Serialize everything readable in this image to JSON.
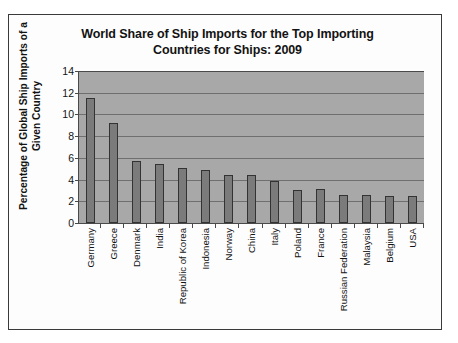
{
  "chart_data": {
    "type": "bar",
    "title": "World Share of Ship Imports for the Top Importing Countries for Ships: 2009",
    "title_lines": [
      "World Share of Ship Imports for the Top Importing",
      "Countries for Ships: 2009"
    ],
    "xlabel": "",
    "ylabel": "Percentage of Global Ship Imports of a Given Country",
    "ylabel_lines": [
      "Percentage of Global Ship Imports of a",
      "Given Country"
    ],
    "ylim": [
      0,
      14
    ],
    "ytick_step": 2,
    "yticks": [
      14,
      12,
      10,
      8,
      6,
      4,
      2,
      0
    ],
    "grid": true,
    "legend": "none",
    "categories": [
      "Germany",
      "Greece",
      "Denmark",
      "India",
      "Republic of Korea",
      "Indonesia",
      "Norway",
      "China",
      "Italy",
      "Poland",
      "France",
      "Russian Federation",
      "Malaysia",
      "Belgium",
      "USA"
    ],
    "values": [
      11.5,
      9.2,
      5.7,
      5.4,
      5.05,
      4.85,
      4.45,
      4.45,
      3.9,
      3.05,
      3.1,
      2.6,
      2.6,
      2.45,
      2.45
    ],
    "colors": {
      "bar_fill": "#7b7b7b",
      "bar_border": "#333333",
      "plot_background": "#a8a8a8",
      "gridline": "#6f6f6f",
      "axis": "#4a4a4a",
      "text": "#131313",
      "page_background": "#fdfdfd",
      "frame_border": "#3a3a3a"
    }
  }
}
